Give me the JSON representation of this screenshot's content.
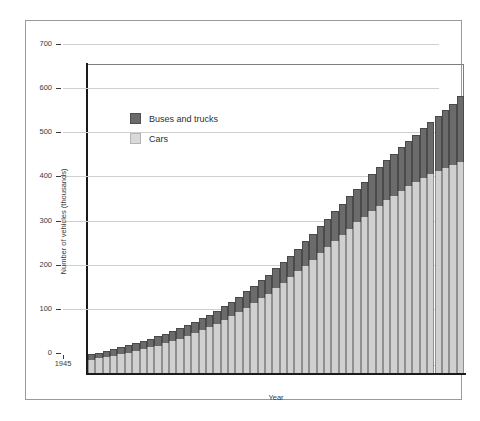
{
  "chart_data": {
    "type": "bar",
    "stacked": true,
    "title": "",
    "xlabel": "Year",
    "ylabel": "Number of vehicles (thousands)",
    "xlim": [
      1945,
      1995
    ],
    "ylim": [
      0,
      700
    ],
    "yticks": [
      0,
      100,
      200,
      300,
      400,
      500,
      600,
      700
    ],
    "xticks": [
      1945,
      1955,
      1965,
      1975,
      1985,
      1995
    ],
    "grid": "horizontal",
    "legend_position": "upper-left-inside",
    "categories": [
      1945,
      1946,
      1947,
      1948,
      1949,
      1950,
      1951,
      1952,
      1953,
      1954,
      1955,
      1956,
      1957,
      1958,
      1959,
      1960,
      1961,
      1962,
      1963,
      1964,
      1965,
      1966,
      1967,
      1968,
      1969,
      1970,
      1971,
      1972,
      1973,
      1974,
      1975,
      1976,
      1977,
      1978,
      1979,
      1980,
      1981,
      1982,
      1983,
      1984,
      1985,
      1986,
      1987,
      1988,
      1989,
      1990,
      1991,
      1992,
      1993,
      1994,
      1995
    ],
    "series": [
      {
        "name": "Cars",
        "color": "#d0d0d0",
        "values": [
          30,
          33,
          36,
          39,
          42,
          46,
          50,
          54,
          58,
          62,
          67,
          72,
          78,
          84,
          90,
          97,
          104,
          112,
          120,
          129,
          138,
          148,
          158,
          169,
          180,
          192,
          204,
          217,
          230,
          243,
          257,
          271,
          285,
          299,
          313,
          327,
          341,
          354,
          367,
          379,
          391,
          402,
          413,
          423,
          433,
          442,
          450,
          458,
          465,
          471,
          477
        ]
      },
      {
        "name": "Buses and trucks",
        "color": "#6b6b6b",
        "values": [
          12,
          13,
          14,
          15,
          16,
          17,
          18,
          19,
          20,
          21,
          22,
          23,
          24,
          25,
          26,
          27,
          28,
          29,
          31,
          33,
          35,
          37,
          39,
          41,
          43,
          45,
          47,
          49,
          52,
          55,
          58,
          61,
          64,
          67,
          70,
          73,
          76,
          79,
          83,
          87,
          91,
          95,
          99,
          103,
          107,
          112,
          118,
          124,
          130,
          138,
          150
        ]
      }
    ],
    "totals": [
      42,
      46,
      50,
      54,
      58,
      63,
      68,
      73,
      78,
      83,
      89,
      95,
      102,
      109,
      116,
      124,
      132,
      141,
      151,
      162,
      173,
      185,
      197,
      210,
      223,
      237,
      251,
      266,
      282,
      298,
      315,
      332,
      349,
      366,
      383,
      400,
      417,
      433,
      450,
      466,
      482,
      497,
      512,
      526,
      540,
      554,
      568,
      582,
      595,
      609,
      627
    ]
  },
  "legend": {
    "entries": [
      {
        "label": "Buses and trucks",
        "swatch": "dark-gray"
      },
      {
        "label": "Cars",
        "swatch": "light-gray"
      }
    ]
  }
}
